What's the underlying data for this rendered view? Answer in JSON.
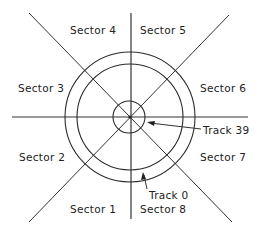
{
  "diagram": {
    "type": "disk-layout",
    "center": [
      130,
      117
    ],
    "circles": {
      "outer_track_radius": 65,
      "inner_track_radius": 53,
      "hub_radius": 16
    },
    "sectors": [
      {
        "label": "Sector 1",
        "x": 70,
        "y": 213
      },
      {
        "label": "Sector 2",
        "x": 19,
        "y": 161
      },
      {
        "label": "Sector 3",
        "x": 18,
        "y": 92
      },
      {
        "label": "Sector 4",
        "x": 70,
        "y": 34
      },
      {
        "label": "Sector 5",
        "x": 140,
        "y": 34
      },
      {
        "label": "Sector 6",
        "x": 200,
        "y": 92
      },
      {
        "label": "Sector 7",
        "x": 200,
        "y": 161
      },
      {
        "label": "Sector 8",
        "x": 140,
        "y": 213
      }
    ],
    "track_labels": {
      "track39": "Track 39",
      "track0": "Track 0"
    },
    "line_color": "#333333",
    "text_color": "#222222"
  }
}
